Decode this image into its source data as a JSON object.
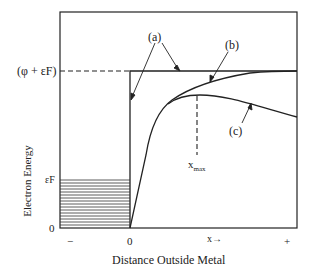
{
  "figure": {
    "y_axis_label": "Electron Energy",
    "x_axis_label": "Distance Outside Metal",
    "y_ticks": {
      "top": "(φ + εF)",
      "fermi": "εF",
      "zero": "0"
    },
    "x_ticks": {
      "minus": "−",
      "zero": "0",
      "x_arrow": "x→",
      "plus": "+"
    },
    "curve_labels": {
      "a": "(a)",
      "b": "(b)",
      "c": "(c)"
    },
    "xmax_label": "x",
    "xmax_sub": "max",
    "line_color": "#222222"
  }
}
